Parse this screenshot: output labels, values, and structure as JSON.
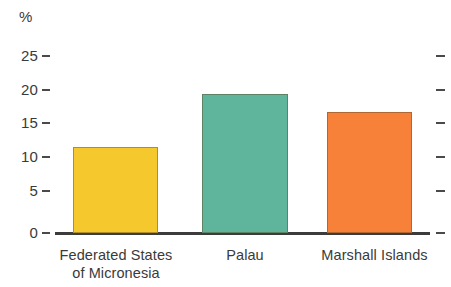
{
  "chart_data": {
    "type": "bar",
    "title": "",
    "subtitle": "",
    "xlabel": "",
    "ylabel": "%",
    "unit_label": "%",
    "categories": [
      "Federated States of Micronesia",
      "Palau",
      "Marshall Islands"
    ],
    "category_lines": [
      [
        "Federated States",
        "of Micronesia"
      ],
      [
        "Palau"
      ],
      [
        "Marshall Islands"
      ]
    ],
    "values": [
      12.1,
      19.5,
      17.0
    ],
    "colors": [
      "#F5C82E",
      "#5FB49C",
      "#F8813A"
    ],
    "ylim": [
      0,
      25
    ],
    "yticks": [
      0,
      5,
      10,
      15,
      20,
      25
    ],
    "ytick_labels": [
      "0",
      "5",
      "10",
      "15",
      "20",
      "25"
    ],
    "grid": false,
    "legend": "none",
    "right_axis_ticks": true
  },
  "axis": {
    "unit": "%",
    "tick_0": "0",
    "tick_5": "5",
    "tick_10": "10",
    "tick_15": "15",
    "tick_20": "20",
    "tick_25": "25"
  },
  "bars": [
    {
      "label_line1": "Federated States",
      "label_line2": "of Micronesia",
      "value": 12.1,
      "color": "#F5C82E"
    },
    {
      "label_line1": "Palau",
      "label_line2": "",
      "value": 19.5,
      "color": "#5FB49C"
    },
    {
      "label_line1": "Marshall Islands",
      "label_line2": "",
      "value": 17.0,
      "color": "#F8813A"
    }
  ]
}
